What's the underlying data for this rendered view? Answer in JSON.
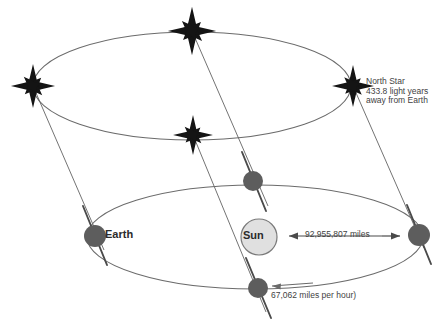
{
  "diagram": {
    "colors": {
      "body_fill": "#5d5d5d",
      "sun_fill": "#e0e0e0",
      "sun_stroke": "#7a7a7a",
      "orbit_stroke": "#6b6b6b",
      "axis_stroke": "#4a4a4a",
      "star_fill": "#1a1a1a",
      "text": "#3a3a3a",
      "background": "#ffffff"
    },
    "labels": {
      "earth": "Earth",
      "sun": "Sun",
      "distance": "92,955,807 miles",
      "speed": "67,062 miles per hour)",
      "north_star_line1": "North Star",
      "north_star_line2": "433.8 light years",
      "north_star_line3": "away from Earth"
    },
    "icons": {
      "star": "star-icon",
      "earth_body": "earth-body-icon",
      "sun_body": "sun-body-icon",
      "arrow_left": "arrow-left-icon",
      "arrow_right": "arrow-right-icon"
    },
    "geometry": {
      "upper_ellipse": {
        "cx": 192,
        "cy": 86,
        "rx": 159,
        "ry": 54
      },
      "lower_ellipse": {
        "cx": 255,
        "cy": 237,
        "rx": 168,
        "ry": 52
      },
      "bodies": [
        {
          "name": "earth",
          "cx": 95,
          "cy": 236,
          "r": 11
        },
        {
          "name": "body-right",
          "cx": 419,
          "cy": 235,
          "r": 11
        },
        {
          "name": "body-top",
          "cx": 253,
          "cy": 181,
          "r": 10
        },
        {
          "name": "body-bottom",
          "cx": 258,
          "cy": 288,
          "r": 10
        }
      ],
      "sun": {
        "cx": 259,
        "cy": 237,
        "r": 18
      },
      "stars": [
        {
          "cx": 192,
          "cy": 31,
          "size": 23
        },
        {
          "cx": 33,
          "cy": 86,
          "size": 21
        },
        {
          "cx": 353,
          "cy": 86,
          "size": 20
        },
        {
          "cx": 193,
          "cy": 135,
          "size": 19
        }
      ]
    }
  }
}
